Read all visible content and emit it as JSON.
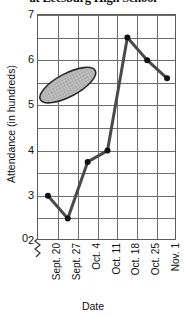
{
  "chart_data": {
    "type": "line",
    "title": "at Leesburg High School",
    "xlabel": "Date",
    "ylabel": "Attendance (in hundreds)",
    "categories": [
      "Sept. 20",
      "Sept. 27",
      "Oct. 4",
      "Oct. 11",
      "Oct. 18",
      "Oct. 25",
      "Nov. 1"
    ],
    "values": [
      3,
      2.5,
      3.75,
      4,
      6.5,
      6,
      5.6
    ],
    "ylim": [
      2,
      7
    ],
    "y_ticks": [
      2,
      3,
      4,
      5,
      6,
      7
    ],
    "y_tick_labels": [
      "2",
      "3",
      "4",
      "5",
      "6",
      "7"
    ],
    "y_gridline_step": 0.5,
    "grid": true,
    "legend": "none",
    "axis_break": true,
    "origin_label": "0",
    "series_color": "#4a4a4a",
    "marker_color": "#111111",
    "grid_color": "#6e6e6e",
    "annotations": [
      {
        "shape": "ellipse",
        "name": "highlight-ellipse",
        "fill": "#b9b9b9",
        "stroke": "#2b2b2b",
        "cx_value": "Sept. 27",
        "cy_value": 5.45,
        "rotation_deg": -28
      }
    ]
  }
}
